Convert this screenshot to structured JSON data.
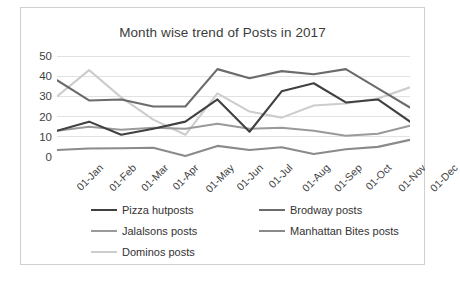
{
  "chart_data": {
    "type": "line",
    "title": "Month wise trend of Posts in 2017",
    "xlabel": "",
    "ylabel": "",
    "ylim": [
      0,
      50
    ],
    "yticks": [
      0,
      10,
      20,
      30,
      40,
      50
    ],
    "grid": true,
    "legend_position": "bottom",
    "categories": [
      "01-Jan",
      "01-Feb",
      "01-Mar",
      "01-Apr",
      "01-May",
      "01-Jun",
      "01-Jul",
      "01-Aug",
      "01-Sep",
      "01-Oct",
      "01-Nov",
      "01-Dec"
    ],
    "series": [
      {
        "name": "Pizza hutposts",
        "color": "#404040",
        "values": [
          13,
          17.5,
          11,
          14,
          17.5,
          28.5,
          12.5,
          32.5,
          36.5,
          27,
          28.5,
          17.5
        ]
      },
      {
        "name": "Brodway posts",
        "color": "#6b6b6b",
        "values": [
          38,
          28,
          28.5,
          25,
          25,
          43.5,
          39,
          42.5,
          41,
          43.5,
          34,
          24.5
        ]
      },
      {
        "name": "Jalalsons posts",
        "color": "#9a9a9a",
        "values": [
          13,
          15,
          13.5,
          14.5,
          14,
          16.5,
          14,
          14.5,
          13,
          10.5,
          11.5,
          15.5
        ]
      },
      {
        "name": "Manhattan Bites posts",
        "color": "#8a8a8a",
        "values": [
          3.5,
          4.2,
          4.3,
          4.6,
          0.5,
          5.5,
          3.5,
          4.8,
          1.5,
          3.8,
          5,
          8.5
        ]
      },
      {
        "name": "Dominos posts",
        "color": "#cdcdcd",
        "values": [
          30,
          43,
          29.5,
          18.5,
          11,
          31.5,
          22.5,
          19.5,
          25.5,
          26.5,
          29,
          34.5
        ]
      }
    ]
  },
  "caption": ""
}
